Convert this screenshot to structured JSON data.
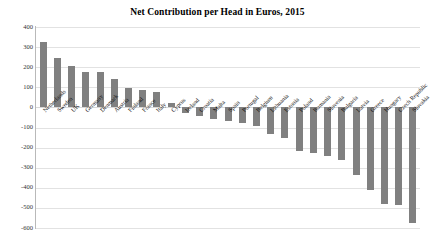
{
  "chart_data": {
    "type": "bar",
    "title": "Net Contribution per Head in Euros, 2015",
    "xlabel": "",
    "ylabel": "",
    "ylim": [
      -600,
      400
    ],
    "ytick_step": 100,
    "yticks": [
      400,
      300,
      200,
      100,
      0,
      -100,
      -200,
      -300,
      -400,
      -500,
      -600
    ],
    "ytick_labels": [
      "400",
      "300",
      "200",
      "100",
      "0",
      "-100",
      "-200",
      "-300",
      "-400",
      "-500",
      "-600"
    ],
    "grid": true,
    "legend": "none",
    "bar_color": "#808080",
    "categories": [
      "Netherlands",
      "Sweden",
      "UK",
      "Germany",
      "Denmark",
      "Austria",
      "Finland",
      "France",
      "Italy",
      "Cyprus",
      "Ireland",
      "Croatia",
      "Malta",
      "Spain",
      "Portugal",
      "Belgium",
      "Lithuania",
      "Estonia",
      "Poland",
      "Romania",
      "Slovenia",
      "Bulgaria",
      "Latvia",
      "Greece",
      "Hungary",
      "Czech Republic",
      "Slovakia"
    ],
    "values": [
      325,
      245,
      205,
      175,
      175,
      140,
      95,
      85,
      75,
      20,
      -30,
      -45,
      -60,
      -70,
      -80,
      -95,
      -130,
      -150,
      -215,
      -225,
      -240,
      -260,
      -335,
      -410,
      -480,
      -485,
      -575
    ]
  },
  "axis": {
    "zero_label": "0"
  }
}
